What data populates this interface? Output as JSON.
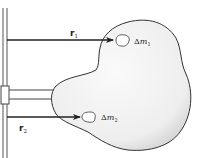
{
  "diagram": {
    "labels": {
      "r1_main": "r",
      "r1_sub": "1",
      "r2_main": "r",
      "r2_sub": "2",
      "m1_delta": "Δ",
      "m1_main": "m",
      "m1_sub": "1",
      "m2_delta": "Δ",
      "m2_main": "m",
      "m2_sub": "2"
    },
    "colors": {
      "line": "#222222",
      "body_fill": "#f1f1f1",
      "body_shade": "#d8d8d8",
      "background": "#ffffff"
    }
  }
}
